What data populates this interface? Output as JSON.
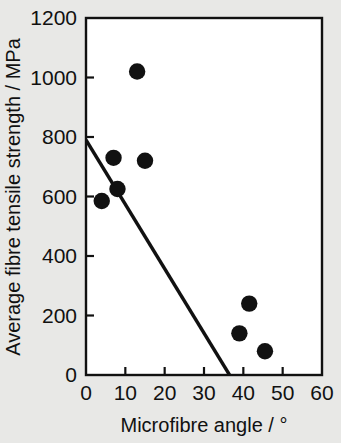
{
  "chart_data": {
    "type": "scatter",
    "title": "",
    "xlabel": "Microfibre angle / °",
    "ylabel": "Average fibre tensile strength / MPa",
    "xlim": [
      0,
      60
    ],
    "ylim": [
      0,
      1200
    ],
    "xticks": [
      0,
      10,
      20,
      30,
      40,
      50,
      60
    ],
    "yticks": [
      0,
      200,
      400,
      600,
      800,
      1000,
      1200
    ],
    "xtick_labels": [
      "0",
      "10",
      "20",
      "30",
      "40",
      "50",
      "60"
    ],
    "ytick_labels": [
      "0",
      "200",
      "400",
      "600",
      "800",
      "1000",
      "1200"
    ],
    "grid": false,
    "legend": "none",
    "marker": "filled-circle",
    "marker_color": "#111111",
    "series": [
      {
        "name": "Fibre measurements",
        "type": "scatter",
        "points": [
          {
            "x": 4,
            "y": 585
          },
          {
            "x": 7,
            "y": 730
          },
          {
            "x": 8,
            "y": 625
          },
          {
            "x": 13,
            "y": 1020
          },
          {
            "x": 15,
            "y": 720
          },
          {
            "x": 39,
            "y": 140
          },
          {
            "x": 41.5,
            "y": 240
          },
          {
            "x": 45.5,
            "y": 80
          }
        ]
      },
      {
        "name": "Linear regression fit",
        "type": "line",
        "points": [
          {
            "x": 0,
            "y": 790
          },
          {
            "x": 36.5,
            "y": 0
          }
        ]
      }
    ]
  },
  "axes": {
    "x_title": "Microfibre angle / °",
    "y_title": "Average fibre tensile strength / MPa"
  },
  "colors": {
    "background": "#e8e8e6",
    "plot_background": "#ffffff",
    "axis": "#111111",
    "marker": "#111111",
    "line": "#111111"
  }
}
